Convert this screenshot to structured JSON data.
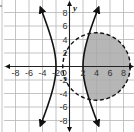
{
  "chart_data": {
    "type": "line",
    "title": "",
    "xlabel": "",
    "ylabel": "y",
    "xlim": [
      -10,
      10
    ],
    "ylim": [
      -10,
      10
    ],
    "grid": true,
    "grid_step": 2,
    "x_tick_labels": [
      "-8",
      "-6",
      "-4",
      "-2",
      "O",
      "2",
      "4",
      "6",
      "8"
    ],
    "y_tick_labels": [
      "8",
      "6",
      "4",
      "2",
      "-2",
      "-4",
      "-6",
      "-8"
    ],
    "series": [
      {
        "name": "hyperbola",
        "style": "solid",
        "equation": "x^2/4 - y^2/21 = 1",
        "center": [
          0,
          0
        ],
        "vertices": [
          [
            -2,
            0
          ],
          [
            2,
            0
          ]
        ],
        "arrows": true
      },
      {
        "name": "circle",
        "style": "dashed",
        "equation": "(x-4)^2 + y^2 = 25",
        "center": [
          4,
          0
        ],
        "radius": 5
      }
    ],
    "shaded_region": "inside circle and right of right hyperbola branch",
    "colors": {
      "grid": "#b5b5b5",
      "axis": "#222222",
      "curve": "#111111",
      "shade": "#a9a9a9"
    }
  },
  "labels": {
    "y_axis": "y",
    "origin": "O"
  }
}
